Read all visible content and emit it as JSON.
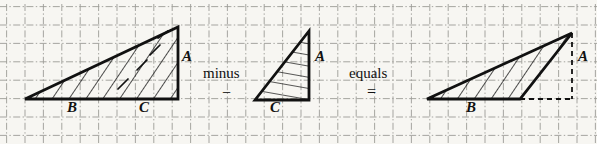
{
  "figure": {
    "background_color": "#f7f6f2",
    "ink_color": "#111111",
    "grid_color": "#8a8a86",
    "grid": {
      "visible": true,
      "style": "dash-dot",
      "spacing_px": 18.4,
      "origin_x": 6,
      "origin_y": 6
    }
  },
  "operators": {
    "minus_word": "minus",
    "minus_symbol": "−",
    "equals_word": "equals",
    "equals_symbol": "="
  },
  "panels": [
    {
      "id": "left-figure",
      "name": "large-hatched-triangle",
      "labels": [
        {
          "text": "A",
          "x": 182,
          "y": 49
        },
        {
          "text": "B",
          "x": 67,
          "y": 100
        },
        {
          "text": "C",
          "x": 139,
          "y": 100
        }
      ],
      "triangle": {
        "vertices": [
          [
            25,
            99
          ],
          [
            178,
            99
          ],
          [
            178,
            27
          ]
        ],
        "hatch": "diagonal",
        "stroke_width": 2.6
      }
    },
    {
      "id": "middle-figure",
      "name": "small-hatched-triangle",
      "labels": [
        {
          "text": "A",
          "x": 315,
          "y": 49
        },
        {
          "text": "C",
          "x": 270,
          "y": 100
        }
      ],
      "triangle": {
        "vertices": [
          [
            255,
            100
          ],
          [
            309,
            100
          ],
          [
            309,
            31
          ]
        ],
        "hatch": "horizontal",
        "stroke_width": 2.6
      }
    },
    {
      "id": "right-figure",
      "name": "difference-thin-triangle",
      "labels": [
        {
          "text": "A",
          "x": 578,
          "y": 49
        },
        {
          "text": "B",
          "x": 466,
          "y": 100
        }
      ],
      "triangle": {
        "vertices": [
          [
            427,
            99
          ],
          [
            520,
            99
          ],
          [
            572,
            33
          ]
        ],
        "hatch": "diagonal",
        "stroke_width": 2.6
      },
      "dashed_guides": [
        {
          "from": [
            520,
            99
          ],
          "to": [
            572,
            99
          ]
        },
        {
          "from": [
            572,
            33
          ],
          "to": [
            572,
            99
          ]
        }
      ]
    }
  ],
  "operator_positions": {
    "minus_word_x": 203,
    "minus_word_y": 66,
    "minus_symbol_x": 222,
    "minus_symbol_y": 85,
    "equals_word_x": 349,
    "equals_word_y": 66,
    "equals_symbol_x": 367,
    "equals_symbol_y": 84
  }
}
